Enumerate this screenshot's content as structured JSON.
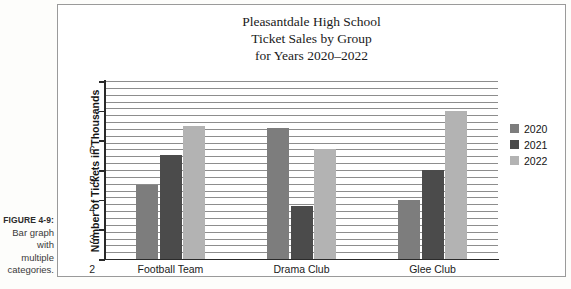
{
  "caption": {
    "figure_number": "FIGURE 4-9:",
    "line1": "Bar graph",
    "line2": "with",
    "line3": "multiple",
    "line4": "categories."
  },
  "chart_data": {
    "type": "bar",
    "title": "Pleasantdale High School Ticket Sales by Group for Years 2020–2022",
    "title_lines": [
      "Pleasantdale High School",
      "Ticket Sales by Group",
      "for Years 2020–2022"
    ],
    "categories": [
      "Football Team",
      "Drama Club",
      "Glee Club"
    ],
    "series": [
      {
        "name": "2020",
        "color": "#7d7d7d",
        "values": [
          2.5,
          4.4,
          2.0
        ]
      },
      {
        "name": "2021",
        "color": "#4b4b4b",
        "values": [
          3.5,
          1.8,
          3.0
        ]
      },
      {
        "name": "2022",
        "color": "#b3b3b3",
        "values": [
          4.5,
          3.7,
          5.0
        ]
      }
    ],
    "xlabel": "",
    "ylabel": "Number of Tickets in Thousands",
    "ylim": [
      0,
      6
    ],
    "yticks": [
      0,
      1,
      2,
      3,
      4,
      5,
      6
    ],
    "ytick_labels": [
      "0",
      "1",
      "2",
      "3",
      "4",
      "5",
      "6"
    ],
    "grid": true,
    "grid_orientation": "horizontal",
    "legend_position": "right"
  }
}
